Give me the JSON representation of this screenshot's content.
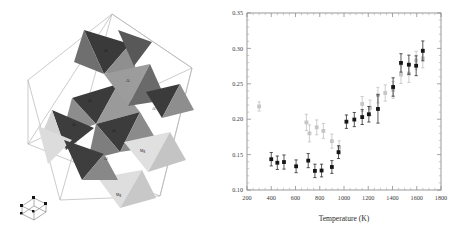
{
  "figure": {
    "panels": [
      "crystal-structure",
      "scatter-plot"
    ]
  },
  "structure": {
    "title": "",
    "cell_outline_color": "#b5b5b5",
    "species": [
      {
        "name": "Al",
        "label": "Al",
        "color": "#3c3c3c",
        "role": "dark polyhedra"
      },
      {
        "name": "Mg",
        "label": "Mg",
        "color": "#d8d8d8",
        "role": "light polyhedra"
      }
    ],
    "labels": [
      "Al",
      "Al",
      "Al",
      "Al",
      "Al",
      "Al",
      "Al",
      "Mg",
      "Mg"
    ],
    "axis_indicator": {
      "name": "unit-cell-axes",
      "vertex_color": "#111111"
    }
  },
  "chart_data": {
    "type": "scatter",
    "title": "",
    "xlabel": "Temperature (K)",
    "ylabel": "",
    "xlim": [
      200,
      1800
    ],
    "ylim": [
      0.1,
      0.35
    ],
    "xticks": [
      200,
      400,
      600,
      800,
      1000,
      1200,
      1400,
      1600,
      1800
    ],
    "xtick_labels": [
      "200",
      "400",
      "600",
      "800",
      "1000",
      "1200",
      "1400",
      "1600",
      "1800"
    ],
    "yticks": [
      0.1,
      0.15,
      0.2,
      0.25,
      0.3,
      0.35
    ],
    "ytick_labels": [
      "0.10",
      "0.15",
      "0.20",
      "0.25",
      "0.30",
      "0.35"
    ],
    "x_minor_step": 50,
    "y_minor_step": 0.01,
    "grid": false,
    "legend": null,
    "series": [
      {
        "name": "dark",
        "marker": "filled-square",
        "color": "#151515",
        "errorbar_color": "#202020",
        "points": [
          {
            "x": 400,
            "y": 0.1435,
            "yerr": 0.0095
          },
          {
            "x": 450,
            "y": 0.1385,
            "yerr": 0.0095
          },
          {
            "x": 505,
            "y": 0.1395,
            "yerr": 0.01
          },
          {
            "x": 605,
            "y": 0.1335,
            "yerr": 0.009
          },
          {
            "x": 705,
            "y": 0.1415,
            "yerr": 0.01
          },
          {
            "x": 760,
            "y": 0.127,
            "yerr": 0.0095
          },
          {
            "x": 815,
            "y": 0.1275,
            "yerr": 0.009
          },
          {
            "x": 900,
            "y": 0.1325,
            "yerr": 0.009
          },
          {
            "x": 955,
            "y": 0.1535,
            "yerr": 0.009
          },
          {
            "x": 1020,
            "y": 0.1965,
            "yerr": 0.0095
          },
          {
            "x": 1085,
            "y": 0.1995,
            "yerr": 0.01
          },
          {
            "x": 1150,
            "y": 0.203,
            "yerr": 0.0105
          },
          {
            "x": 1205,
            "y": 0.207,
            "yerr": 0.011
          },
          {
            "x": 1280,
            "y": 0.2145,
            "yerr": 0.02
          },
          {
            "x": 1405,
            "y": 0.2455,
            "yerr": 0.013
          },
          {
            "x": 1470,
            "y": 0.2795,
            "yerr": 0.013
          },
          {
            "x": 1535,
            "y": 0.277,
            "yerr": 0.0135
          },
          {
            "x": 1595,
            "y": 0.2755,
            "yerr": 0.014
          },
          {
            "x": 1650,
            "y": 0.2965,
            "yerr": 0.014
          }
        ]
      },
      {
        "name": "light",
        "marker": "filled-square",
        "color": "#c6c6c6",
        "errorbar_color": "#bdbdbd",
        "points": [
          {
            "x": 300,
            "y": 0.218,
            "yerr": 0.0065
          },
          {
            "x": 690,
            "y": 0.1955,
            "yerr": 0.0115
          },
          {
            "x": 715,
            "y": 0.18,
            "yerr": 0.012
          },
          {
            "x": 775,
            "y": 0.1885,
            "yerr": 0.0105
          },
          {
            "x": 830,
            "y": 0.1835,
            "yerr": 0.0105
          },
          {
            "x": 900,
            "y": 0.169,
            "yerr": 0.01
          },
          {
            "x": 960,
            "y": 0.16,
            "yerr": 0.0095
          },
          {
            "x": 1150,
            "y": 0.2215,
            "yerr": 0.0105
          },
          {
            "x": 1215,
            "y": 0.216,
            "yerr": 0.011
          },
          {
            "x": 1280,
            "y": 0.234,
            "yerr": 0.011
          },
          {
            "x": 1340,
            "y": 0.237,
            "yerr": 0.0115
          },
          {
            "x": 1405,
            "y": 0.2415,
            "yerr": 0.012
          },
          {
            "x": 1470,
            "y": 0.263,
            "yerr": 0.0125
          },
          {
            "x": 1535,
            "y": 0.2645,
            "yerr": 0.0125
          },
          {
            "x": 1595,
            "y": 0.283,
            "yerr": 0.013
          },
          {
            "x": 1650,
            "y": 0.286,
            "yerr": 0.0135
          }
        ]
      }
    ]
  }
}
